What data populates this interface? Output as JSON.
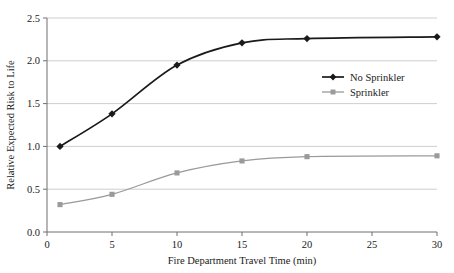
{
  "chart_data": {
    "type": "line",
    "title": "",
    "xlabel": "Fire Department Travel Time (min)",
    "ylabel": "Relative Expected Risk to Life",
    "xlim": [
      0,
      30
    ],
    "ylim": [
      0.0,
      2.5
    ],
    "xticks": [
      "0",
      "5",
      "10",
      "15",
      "20",
      "25",
      "30"
    ],
    "xtick_values": [
      0,
      5,
      10,
      15,
      20,
      25,
      30
    ],
    "yticks": [
      "0.0",
      "0.5",
      "1.0",
      "1.5",
      "2.0",
      "2.5"
    ],
    "ytick_values": [
      0.0,
      0.5,
      1.0,
      1.5,
      2.0,
      2.5
    ],
    "grid": "horizontal",
    "legend_position": "center-right",
    "x": [
      1,
      5,
      10,
      15,
      20,
      30
    ],
    "series": [
      {
        "name": "No Sprinkler",
        "color": "#1a1a1a",
        "marker": "diamond",
        "values": [
          1.0,
          1.38,
          1.95,
          2.21,
          2.26,
          2.28
        ]
      },
      {
        "name": "Sprinkler",
        "color": "#9a9a9a",
        "marker": "square",
        "values": [
          0.32,
          0.44,
          0.69,
          0.83,
          0.88,
          0.89
        ]
      }
    ]
  },
  "legend": {
    "items": [
      {
        "label": "No Sprinkler"
      },
      {
        "label": "Sprinkler"
      }
    ]
  },
  "colors": {
    "series_no_sprinkler": "#1a1a1a",
    "series_sprinkler": "#9a9a9a",
    "gridline": "#c8c8c8",
    "axis": "#6e6e6e",
    "background": "#ffffff"
  }
}
